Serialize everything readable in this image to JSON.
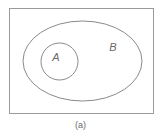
{
  "diagram": {
    "type": "venn",
    "universe": {
      "shape": "rectangle",
      "x": 9,
      "y": 8,
      "width": 144,
      "height": 105,
      "stroke": "#9a9a9a"
    },
    "sets": [
      {
        "label": "B",
        "shape": "ellipse",
        "cx": 82.5,
        "cy": 61,
        "rx": 59.5,
        "ry": 40,
        "label_x": 113,
        "label_y": 51,
        "stroke": "#8a8a8a"
      },
      {
        "label": "A",
        "shape": "circle",
        "cx": 59.5,
        "cy": 61.5,
        "r": 18.5,
        "label_x": 56,
        "label_y": 61,
        "stroke": "#8a8a8a"
      }
    ],
    "relationship": "A ⊂ B"
  },
  "caption": "(a)"
}
